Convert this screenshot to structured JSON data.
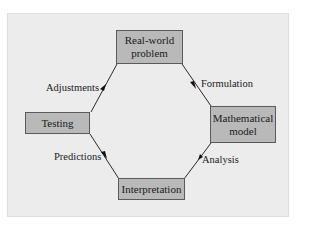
{
  "diagram": {
    "nodes": [
      {
        "id": "real-world-problem",
        "label": "Real-world\nproblem"
      },
      {
        "id": "mathematical-model",
        "label": "Mathematical\nmodel"
      },
      {
        "id": "interpretation",
        "label": "Interpretation"
      },
      {
        "id": "testing",
        "label": "Testing"
      }
    ],
    "edges": [
      {
        "from": "real-world-problem",
        "to": "mathematical-model",
        "label": "Formulation"
      },
      {
        "from": "mathematical-model",
        "to": "interpretation",
        "label": "Analysis"
      },
      {
        "from": "interpretation",
        "to": "testing",
        "label": "Predictions"
      },
      {
        "from": "testing",
        "to": "real-world-problem",
        "label": "Adjustments"
      }
    ],
    "colors": {
      "box_fill": "#b9b9b9",
      "box_border": "#5a5a5a",
      "panel": "#ececec",
      "line": "#2a2a2a"
    }
  },
  "labels": {
    "real_world_1": "Real-world",
    "real_world_2": "problem",
    "math_1": "Mathematical",
    "math_2": "model",
    "interpretation": "Interpretation",
    "testing": "Testing",
    "formulation": "Formulation",
    "analysis": "Analysis",
    "predictions": "Predictions",
    "adjustments": "Adjustments"
  }
}
